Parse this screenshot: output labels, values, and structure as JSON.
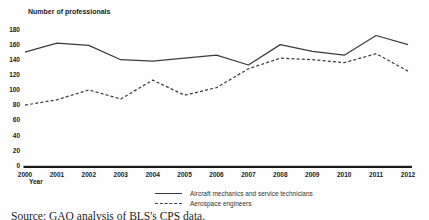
{
  "chart_data": {
    "type": "line",
    "title": "Number of professionals",
    "xlabel": "Year",
    "ylabel": "Number of professionals",
    "x": [
      2000,
      2001,
      2002,
      2003,
      2004,
      2005,
      2006,
      2007,
      2008,
      2009,
      2010,
      2011,
      2012
    ],
    "series": [
      {
        "name": "Aircraft mechanics and service technicians",
        "style": "solid",
        "values": [
          150,
          162,
          159,
          140,
          138,
          142,
          146,
          133,
          160,
          151,
          146,
          172,
          160
        ]
      },
      {
        "name": "Aerospace engineers",
        "style": "dashed",
        "values": [
          80,
          87,
          100,
          88,
          113,
          93,
          103,
          128,
          142,
          140,
          136,
          148,
          125
        ]
      }
    ],
    "ylim": [
      0,
      180
    ],
    "ytick_step": 20,
    "grid": false,
    "legend_position": "bottom-center",
    "line_color": "#3d3d3d",
    "axis_color": "#1c1c1c",
    "tick_label_color": "#222222"
  },
  "footer": {
    "source": "Source: GAO analysis of BLS's CPS data."
  }
}
